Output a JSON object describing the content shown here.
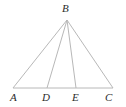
{
  "figure": {
    "type": "geometry-diagram",
    "background_color": "#ffffff",
    "line_color": "#b8b8b8",
    "label_color": "#2b2b2b",
    "line_width": 1,
    "points": {
      "A": {
        "label": "A",
        "x": 13,
        "y": 88,
        "label_x": 10,
        "label_y": 92
      },
      "B": {
        "label": "B",
        "x": 67,
        "y": 20,
        "label_x": 62,
        "label_y": 3
      },
      "C": {
        "label": "C",
        "x": 113,
        "y": 88,
        "label_x": 105,
        "label_y": 92
      },
      "D": {
        "label": "D",
        "x": 47,
        "y": 88,
        "label_x": 42,
        "label_y": 92
      },
      "E": {
        "label": "E",
        "x": 76,
        "y": 88,
        "label_x": 72,
        "label_y": 92
      }
    },
    "segments": [
      {
        "name": "AB",
        "from": "A",
        "to": "B"
      },
      {
        "name": "BC",
        "from": "B",
        "to": "C"
      },
      {
        "name": "AC",
        "from": "A",
        "to": "C"
      },
      {
        "name": "BD",
        "from": "B",
        "to": "D"
      },
      {
        "name": "BE",
        "from": "B",
        "to": "E"
      }
    ]
  }
}
